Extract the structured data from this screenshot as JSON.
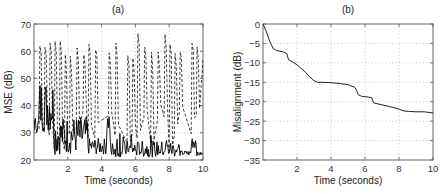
{
  "chart_data": [
    {
      "id": "a",
      "type": "line",
      "title": "(a)",
      "xlabel": "Time (seconds)",
      "ylabel": "MSE (dB)",
      "xlim": [
        0,
        10
      ],
      "ylim": [
        20,
        70
      ],
      "xticks": [
        2,
        4,
        6,
        8,
        10
      ],
      "yticks": [
        20,
        30,
        40,
        50,
        60,
        70
      ],
      "grid": true,
      "legend": "none",
      "series": [
        {
          "name": "dashed",
          "style": "dashed",
          "description": "Dense, rapidly oscillating trace. It repeatedly spikes to roughly 55-67 dB and drops to about 22-40 dB many times across 0-10 s. Individual samples cannot be read from the image.",
          "approx_range_db": [
            22,
            67
          ]
        },
        {
          "name": "solid",
          "style": "solid",
          "description": "Noisy trace that starts high (peaks near 50 dB around 0.3-1 s) and settles mostly between about 21 and 30 dB. It has intermittent bursts up to about 38 dB. Individual samples cannot be read from the image.",
          "approx_range_db": [
            21,
            50
          ]
        }
      ]
    },
    {
      "id": "b",
      "type": "line",
      "title": "(b)",
      "xlabel": "Time (seconds)",
      "ylabel": "Misalignment (dB)",
      "xlim": [
        0,
        10
      ],
      "ylim": [
        -35,
        0
      ],
      "xticks": [
        2,
        4,
        6,
        8,
        10
      ],
      "yticks": [
        0,
        -5,
        -10,
        -15,
        -20,
        -25,
        -30,
        -35
      ],
      "grid": true,
      "legend": "none",
      "series": [
        {
          "name": "misalignment",
          "style": "solid",
          "x": [
            0,
            0.2,
            0.4,
            0.6,
            0.8,
            1.0,
            1.2,
            1.4,
            1.5,
            1.8,
            2.0,
            2.2,
            2.5,
            2.7,
            3.0,
            3.2,
            3.5,
            4.0,
            4.5,
            5.0,
            5.4,
            5.5,
            5.6,
            5.8,
            6.2,
            6.4,
            6.5,
            7.0,
            7.5,
            8.0,
            8.3,
            8.6,
            9.0,
            9.5,
            10.0
          ],
          "y": [
            0,
            -2,
            -4.5,
            -6.3,
            -6.8,
            -7.0,
            -7.2,
            -7.6,
            -9.2,
            -9.9,
            -10.5,
            -11.3,
            -12.4,
            -13.4,
            -14.6,
            -15.0,
            -15.0,
            -15.1,
            -15.3,
            -15.6,
            -16.3,
            -17.0,
            -18.2,
            -18.6,
            -18.8,
            -19.0,
            -20.3,
            -20.8,
            -21.3,
            -21.9,
            -22.4,
            -22.5,
            -22.6,
            -22.6,
            -22.9
          ]
        }
      ]
    }
  ]
}
